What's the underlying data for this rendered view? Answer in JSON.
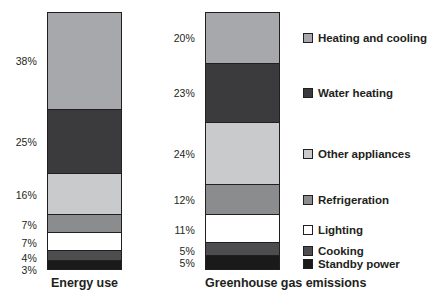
{
  "chart_data": {
    "type": "bar",
    "subtype": "stacked-bar-100",
    "title": "",
    "xlabel": "",
    "ylabel": "",
    "ylim": [
      0,
      100
    ],
    "grid": false,
    "legend_position": "right",
    "categories": [
      "Energy use",
      "Greenhouse gas emissions"
    ],
    "series": [
      {
        "name": "Heating and cooling",
        "color": "#a6a8ab",
        "values": [
          38,
          20
        ],
        "value_labels": [
          "38%",
          "20%"
        ]
      },
      {
        "name": "Water heating",
        "color": "#3b3b3d",
        "values": [
          25,
          23
        ],
        "value_labels": [
          "25%",
          "23%"
        ]
      },
      {
        "name": "Other appliances",
        "color": "#c9cacc",
        "values": [
          16,
          24
        ],
        "value_labels": [
          "16%",
          "24%"
        ]
      },
      {
        "name": "Refrigeration",
        "color": "#8a8c8e",
        "values": [
          7,
          12
        ],
        "value_labels": [
          "7%",
          "12%"
        ]
      },
      {
        "name": "Lighting",
        "color": "#ffffff",
        "values": [
          7,
          11
        ],
        "value_labels": [
          "7%",
          "11%"
        ]
      },
      {
        "name": "Cooking",
        "color": "#4d4d4f",
        "values": [
          4,
          5
        ],
        "value_labels": [
          "4%",
          "5%"
        ]
      },
      {
        "name": "Standby power",
        "color": "#1a1a1a",
        "values": [
          3,
          5
        ],
        "value_labels": [
          "3%",
          "5%"
        ]
      }
    ]
  },
  "bars": [
    {
      "category": "Energy use",
      "segments": [
        {
          "label": "Heating and cooling",
          "value_label": "38%",
          "value": 38,
          "color": "#a6a8ab"
        },
        {
          "label": "Water heating",
          "value_label": "25%",
          "value": 25,
          "color": "#3b3b3d"
        },
        {
          "label": "Other appliances",
          "value_label": "16%",
          "value": 16,
          "color": "#c9cacc"
        },
        {
          "label": "Refrigeration",
          "value_label": "7%",
          "value": 7,
          "color": "#8a8c8e"
        },
        {
          "label": "Lighting",
          "value_label": "7%",
          "value": 7,
          "color": "#ffffff"
        },
        {
          "label": "Cooking",
          "value_label": "4%",
          "value": 4,
          "color": "#4d4d4f"
        },
        {
          "label": "Standby power",
          "value_label": "3%",
          "value": 3,
          "color": "#1a1a1a"
        }
      ]
    },
    {
      "category": "Greenhouse gas emissions",
      "segments": [
        {
          "label": "Heating and cooling",
          "value_label": "20%",
          "value": 20,
          "color": "#a6a8ab"
        },
        {
          "label": "Water heating",
          "value_label": "23%",
          "value": 23,
          "color": "#3b3b3d"
        },
        {
          "label": "Other appliances",
          "value_label": "24%",
          "value": 24,
          "color": "#c9cacc"
        },
        {
          "label": "Refrigeration",
          "value_label": "12%",
          "value": 12,
          "color": "#8a8c8e"
        },
        {
          "label": "Lighting",
          "value_label": "11%",
          "value": 11,
          "color": "#ffffff"
        },
        {
          "label": "Cooking",
          "value_label": "5%",
          "value": 5,
          "color": "#4d4d4f"
        },
        {
          "label": "Standby power",
          "value_label": "5%",
          "value": 5,
          "color": "#1a1a1a"
        }
      ]
    }
  ],
  "legend": {
    "items": [
      {
        "label": "Heating and cooling",
        "color": "#a6a8ab"
      },
      {
        "label": "Water heating",
        "color": "#3b3b3d"
      },
      {
        "label": "Other appliances",
        "color": "#c9cacc"
      },
      {
        "label": "Refrigeration",
        "color": "#8a8c8e"
      },
      {
        "label": "Lighting",
        "color": "#ffffff"
      },
      {
        "label": "Cooking",
        "color": "#4d4d4f"
      },
      {
        "label": "Standby power",
        "color": "#1a1a1a"
      }
    ]
  },
  "colors": {
    "outline": "#231f20",
    "text": "#231f20",
    "background": "#ffffff"
  }
}
